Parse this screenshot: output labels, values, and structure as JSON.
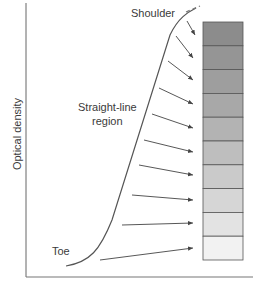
{
  "labels": {
    "shoulder": "Shoulder",
    "straight_line": "Straight-line",
    "straight_line_2": "region",
    "toe": "Toe",
    "y_axis": "Optical density"
  },
  "wedge": {
    "steps": 10,
    "colors": [
      "#8c8c8c",
      "#959595",
      "#9e9e9e",
      "#a8a8a8",
      "#b3b3b3",
      "#bebebe",
      "#cacaca",
      "#d6d6d6",
      "#e3e3e3",
      "#f2f2f2"
    ]
  },
  "colors": {
    "axis": "#555555",
    "curve": "#555555",
    "arrow": "#444444",
    "wedge_border": "#555555"
  }
}
